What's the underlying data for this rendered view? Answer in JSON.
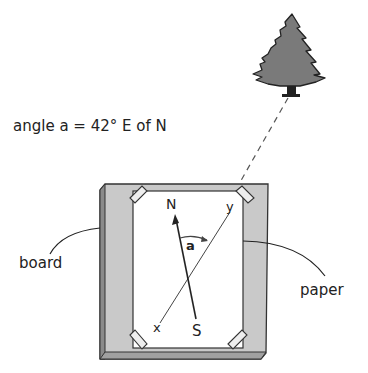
{
  "caption": {
    "angle_text": "angle a = 42° E of N"
  },
  "labels": {
    "board": "board",
    "paper": "paper",
    "north": "N",
    "south": "S",
    "x_point": "x",
    "y_point": "y",
    "angle_symbol": "a"
  },
  "colors": {
    "board_fill": "#c8c8c8",
    "board_edge": "#6e6e6e",
    "paper_fill": "#ffffff",
    "tree_fill": "#7a7a7a",
    "line": "#222222"
  }
}
